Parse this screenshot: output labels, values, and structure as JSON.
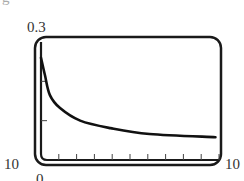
{
  "labels": {
    "corner_fragment": "g",
    "y_max": "0.3",
    "x_min": "10",
    "x_max": "10",
    "origin": "0"
  },
  "chart_data": {
    "type": "line",
    "title": "",
    "xlabel": "",
    "ylabel": "",
    "xlim": [
      0,
      10
    ],
    "ylim": [
      0,
      0.3
    ],
    "grid": false,
    "x_ticks": [
      1,
      2,
      3,
      4,
      5,
      6,
      7,
      8,
      9,
      10
    ],
    "y_ticks": [
      0.1,
      0.2
    ],
    "tick_labels": {
      "y_top": "0.3",
      "x_left": "10",
      "x_right": "10",
      "origin": "0"
    },
    "series": [
      {
        "name": "curve",
        "x": [
          0.0,
          0.22,
          0.5,
          1.07,
          2.2,
          3.9,
          6.1,
          9.8
        ],
        "y": [
          0.26,
          0.216,
          0.165,
          0.132,
          0.1,
          0.081,
          0.066,
          0.058
        ]
      }
    ],
    "colors": {
      "frame": "#1a1a1a",
      "curve": "#111111",
      "text": "#333333"
    }
  }
}
